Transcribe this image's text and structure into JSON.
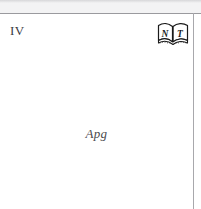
{
  "page": {
    "background_color": "#ffffff",
    "rule_color": "#9a9a9e",
    "top_strip_color": "#f3f3f4"
  },
  "header": {
    "section_numeral": "IV",
    "numeral_color": "#3b3b3f"
  },
  "book_icon": {
    "name": "open-book-nt-icon",
    "left_page_letter": "N",
    "right_page_letter": "T",
    "ink_color": "#1a1a1a",
    "page_color": "#ffffff"
  },
  "running_title": {
    "text": "Apg",
    "color": "#4a4a4e"
  }
}
